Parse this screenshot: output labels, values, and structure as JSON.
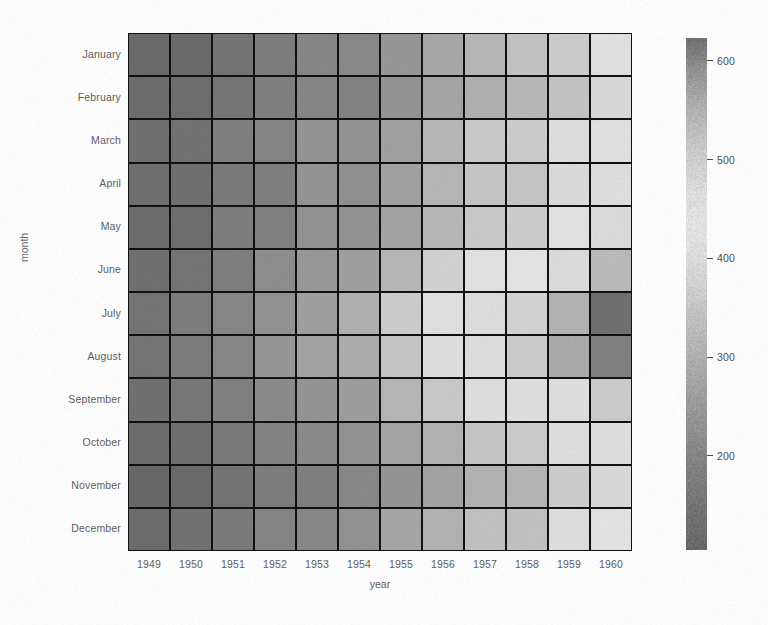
{
  "figure": {
    "background": "#fefefe",
    "width": 768,
    "height": 625
  },
  "axis": {
    "xlabel": "year",
    "ylabel": "month"
  },
  "chart_data": {
    "type": "heatmap",
    "title": "",
    "xlabel": "year",
    "ylabel": "month",
    "categories_x": [
      "1949",
      "1950",
      "1951",
      "1952",
      "1953",
      "1954",
      "1955",
      "1956",
      "1957",
      "1958",
      "1959",
      "1960"
    ],
    "categories_y": [
      "January",
      "February",
      "March",
      "April",
      "May",
      "June",
      "July",
      "August",
      "September",
      "October",
      "November",
      "December"
    ],
    "value_name": "passengers",
    "vmin": 104,
    "vmax": 622,
    "cmap": "grayscale-diverging",
    "grid": true,
    "linecolor": "#111111",
    "linewidth": 2,
    "colorbar": {
      "position": "right",
      "ticks": [
        600,
        500,
        400,
        300,
        200
      ],
      "tick_labels": [
        "600",
        "500",
        "400",
        "300",
        "200"
      ],
      "range": [
        104,
        622
      ]
    },
    "values": [
      [
        112,
        115,
        145,
        171,
        196,
        204,
        242,
        284,
        315,
        340,
        360,
        417
      ],
      [
        118,
        126,
        150,
        180,
        196,
        188,
        233,
        277,
        301,
        318,
        342,
        391
      ],
      [
        132,
        141,
        178,
        193,
        236,
        235,
        267,
        317,
        356,
        362,
        406,
        419
      ],
      [
        129,
        135,
        163,
        181,
        235,
        227,
        269,
        313,
        348,
        348,
        396,
        461
      ],
      [
        121,
        125,
        172,
        183,
        229,
        234,
        270,
        318,
        355,
        363,
        420,
        472
      ],
      [
        135,
        149,
        178,
        218,
        243,
        264,
        315,
        374,
        422,
        435,
        472,
        535
      ],
      [
        148,
        170,
        199,
        230,
        264,
        302,
        364,
        413,
        465,
        491,
        548,
        622
      ],
      [
        148,
        170,
        199,
        242,
        272,
        293,
        347,
        405,
        467,
        505,
        559,
        606
      ],
      [
        136,
        158,
        184,
        209,
        237,
        259,
        312,
        355,
        404,
        404,
        463,
        508
      ],
      [
        119,
        133,
        162,
        191,
        211,
        229,
        274,
        306,
        347,
        359,
        407,
        461
      ],
      [
        104,
        114,
        146,
        172,
        180,
        203,
        237,
        271,
        305,
        310,
        362,
        390
      ],
      [
        118,
        140,
        166,
        194,
        201,
        229,
        278,
        306,
        336,
        337,
        405,
        432
      ]
    ]
  }
}
